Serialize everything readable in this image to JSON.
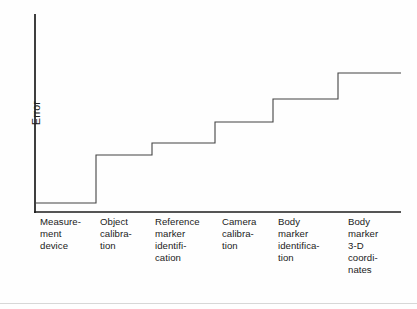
{
  "figure": {
    "ylabel": "Error",
    "xlabel": ""
  },
  "chart_data": {
    "type": "line",
    "subtype": "step",
    "title": "",
    "xlabel": "",
    "ylabel": "Error",
    "grid": false,
    "legend": null,
    "categories": [
      "Measurement device",
      "Object calibration",
      "Reference marker identification",
      "Camera calibration",
      "Body marker identification",
      "Body marker 3-D coordinates"
    ],
    "values": [
      0.03,
      0.27,
      0.34,
      0.46,
      0.58,
      0.72
    ],
    "ylim": [
      0,
      1
    ],
    "axis_ticks": [],
    "note": "Cumulative step function: error increases at each successive processing stage"
  },
  "categories": [
    {
      "id": "measurement-device",
      "lines": [
        "Measure-",
        "ment",
        "device"
      ],
      "left": 40,
      "step_x_start": 35,
      "step_x_end": 96,
      "level": 203
    },
    {
      "id": "object-calibration",
      "lines": [
        "Object",
        "calibra-",
        "tion"
      ],
      "left": 100,
      "step_x_start": 96,
      "step_x_end": 152,
      "level": 155
    },
    {
      "id": "reference-marker-identification",
      "lines": [
        "Reference",
        "marker",
        "identifi-",
        "cation"
      ],
      "left": 155,
      "step_x_start": 152,
      "step_x_end": 215,
      "level": 143
    },
    {
      "id": "camera-calibration",
      "lines": [
        "Camera",
        "calibra-",
        "tion"
      ],
      "left": 222,
      "step_x_start": 215,
      "step_x_end": 273,
      "level": 122
    },
    {
      "id": "body-marker-identification",
      "lines": [
        "Body",
        "marker",
        "identifica-",
        "tion"
      ],
      "left": 278,
      "step_x_start": 273,
      "step_x_end": 338,
      "level": 99
    },
    {
      "id": "body-marker-3d-coordinates",
      "lines": [
        "Body",
        "marker",
        "3-D",
        "coordi-",
        "nates"
      ],
      "left": 348,
      "step_x_start": 338,
      "step_x_end": 401,
      "level": 73
    }
  ],
  "geometry": {
    "y_axis_x": 35,
    "y_axis_top": 14,
    "y_axis_bottom": 213,
    "x_axis_y": 212,
    "x_axis_left": 34,
    "x_axis_right": 401
  },
  "colors": {
    "axis": "#1d1d1d",
    "step_line": "#434343",
    "text": "#222222",
    "background": "#fefefe",
    "bottom_rule": "#d7d7d7"
  }
}
